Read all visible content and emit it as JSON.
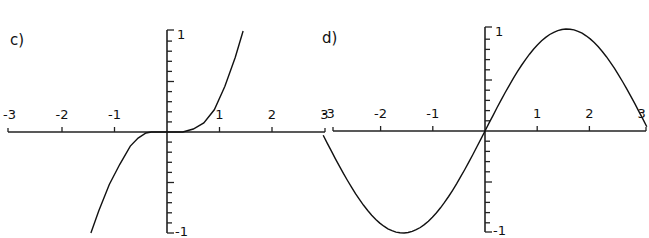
{
  "chart_data": [
    {
      "type": "line",
      "panel_label": "c)",
      "function": "x^3 (approx.)",
      "x_range": [
        -3,
        3
      ],
      "ylim": [
        -1,
        1
      ],
      "xticks": [
        -3,
        -2,
        -1,
        1,
        2,
        3
      ],
      "xtick_labels": [
        "-3",
        "-2",
        "-1",
        "1",
        "2",
        "3"
      ],
      "ytick_labels": [
        "1",
        "-1"
      ],
      "y_minor_ticks": 10,
      "series": [
        {
          "name": "curve",
          "x": [
            -1.45,
            -1.3,
            -1.1,
            -0.9,
            -0.7,
            -0.55,
            -0.4,
            -0.3,
            0,
            0.3,
            0.5,
            0.7,
            0.9,
            1.1,
            1.3,
            1.45
          ],
          "y": [
            -1.0,
            -0.78,
            -0.52,
            -0.32,
            -0.14,
            -0.06,
            -0.01,
            0,
            0,
            0,
            0.03,
            0.09,
            0.22,
            0.45,
            0.74,
            1.0
          ]
        }
      ],
      "xlabel": "",
      "ylabel": "",
      "title": ""
    },
    {
      "type": "line",
      "panel_label": "d)",
      "function": "sin(x)",
      "x_range": [
        -3,
        3
      ],
      "ylim": [
        -1,
        1
      ],
      "xticks": [
        -3,
        -2,
        -1,
        1,
        2,
        3
      ],
      "xtick_labels": [
        "-3",
        "-2",
        "-1",
        "1",
        "2",
        "3"
      ],
      "ytick_labels": [
        "1",
        "-1"
      ],
      "y_minor_ticks": 10,
      "series": [
        {
          "name": "sin(x)",
          "x_from": -3.1,
          "x_to": 3.1,
          "samples": 80,
          "formula": "sin"
        }
      ],
      "xlabel": "",
      "ylabel": "",
      "title": ""
    }
  ]
}
